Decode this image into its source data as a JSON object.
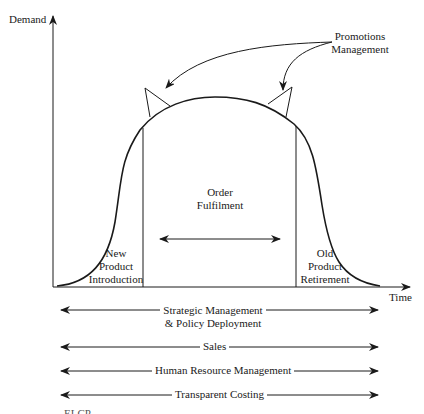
{
  "diagram": {
    "axes": {
      "y_label": "Demand",
      "x_label": "Time"
    },
    "callout": {
      "label_line1": "Promotions",
      "label_line2": "Management"
    },
    "phases": [
      {
        "id": "introduction",
        "line1": "New",
        "line2": "Product",
        "line3": "Introduction"
      },
      {
        "id": "fulfilment",
        "line1": "Order",
        "line2": "Fulfilment"
      },
      {
        "id": "retirement",
        "line1": "Old",
        "line2": "Product",
        "line3": "Retirement"
      }
    ],
    "spanning_processes": [
      {
        "line1": "Strategic Management",
        "line2": "& Policy Deployment"
      },
      {
        "line1": "Sales"
      },
      {
        "line1": "Human Resource Management"
      },
      {
        "line1": "Transparent Costing"
      }
    ],
    "caption_fragment": "... ... ... ... ELCP ... ..."
  },
  "colors": {
    "ink": "#1a1a1a",
    "background": "#ffffff"
  }
}
